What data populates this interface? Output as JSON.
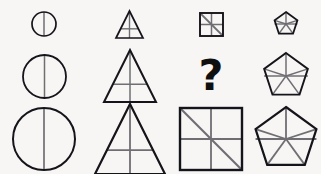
{
  "puzzle": {
    "kind": "matrix-reasoning-puzzle",
    "background_color": "#f7f6f4",
    "outline_color": "#15141a",
    "inner_line_color": "#6f6e73",
    "missing_cell_marker": "?",
    "rows": [
      {
        "row_label": "row-1-small",
        "size_label": "small",
        "cells": [
          {
            "name": "circle-small",
            "shape": "circle",
            "size": 24,
            "stroke": 1.7,
            "inner_lines": [
              "vertical-diameter"
            ],
            "inner_stroke": 1.5
          },
          {
            "name": "triangle-small",
            "shape": "triangle",
            "size": 27,
            "stroke": 1.7,
            "inner_lines": [
              "vertical-median",
              "horizontal-midline"
            ],
            "inner_stroke": 1.4
          },
          {
            "name": "square-small",
            "shape": "square",
            "size": 23,
            "stroke": 1.9,
            "inner_lines": [
              "vertical-midline",
              "horizontal-midline",
              "diagonal-tl-br"
            ],
            "inner_stroke": 1.5
          },
          {
            "name": "pentagon-small",
            "shape": "pentagon",
            "size": 24,
            "stroke": 1.8,
            "inner_lines": [
              "spokes-to-vertices",
              "horizontal-diameter"
            ],
            "inner_stroke": 1.4
          }
        ]
      },
      {
        "row_label": "row-2-medium",
        "size_label": "medium",
        "cells": [
          {
            "name": "circle-medium",
            "shape": "circle",
            "size": 43,
            "stroke": 1.8,
            "inner_lines": [
              "vertical-diameter"
            ],
            "inner_stroke": 1.5
          },
          {
            "name": "triangle-medium",
            "shape": "triangle",
            "size": 52,
            "stroke": 2.0,
            "inner_lines": [
              "vertical-median",
              "horizontal-midline"
            ],
            "inner_stroke": 1.5
          },
          {
            "name": "missing-cell",
            "shape": "question-mark",
            "size": 43,
            "stroke": 0,
            "inner_lines": [],
            "inner_stroke": 0
          },
          {
            "name": "pentagon-medium",
            "shape": "pentagon",
            "size": 46,
            "stroke": 1.9,
            "inner_lines": [
              "spokes-to-vertices",
              "horizontal-diameter"
            ],
            "inner_stroke": 1.5
          }
        ]
      },
      {
        "row_label": "row-3-large",
        "size_label": "large",
        "cells": [
          {
            "name": "circle-large",
            "shape": "circle",
            "size": 62,
            "stroke": 2.0,
            "inner_lines": [
              "vertical-diameter"
            ],
            "inner_stroke": 1.7
          },
          {
            "name": "triangle-large",
            "shape": "triangle",
            "size": 70,
            "stroke": 2.2,
            "inner_lines": [
              "vertical-median",
              "horizontal-midline"
            ],
            "inner_stroke": 1.8
          },
          {
            "name": "square-large",
            "shape": "square",
            "size": 62,
            "stroke": 2.4,
            "inner_lines": [
              "vertical-midline",
              "horizontal-midline",
              "diagonal-tl-br"
            ],
            "inner_stroke": 1.8
          },
          {
            "name": "pentagon-large",
            "shape": "pentagon",
            "size": 64,
            "stroke": 2.2,
            "inner_lines": [
              "spokes-to-vertices",
              "horizontal-diameter"
            ],
            "inner_stroke": 1.8
          }
        ]
      }
    ]
  }
}
